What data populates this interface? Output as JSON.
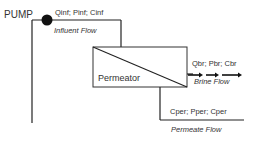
{
  "diagram": {
    "pump_label": "PUMP",
    "influent": {
      "vars": "Qinf; Pinf; Cinf",
      "name": "Influent Flow"
    },
    "permeator_label": "Permeator",
    "brine": {
      "vars": "Qbr; Pbr; Cbr",
      "name": "Brine Flow"
    },
    "permeate": {
      "vars": "Cper; Pper; Cper",
      "name": "Permeate Flow"
    },
    "colors": {
      "line": "#222222",
      "pump": "#111111",
      "background": "#ffffff"
    }
  }
}
